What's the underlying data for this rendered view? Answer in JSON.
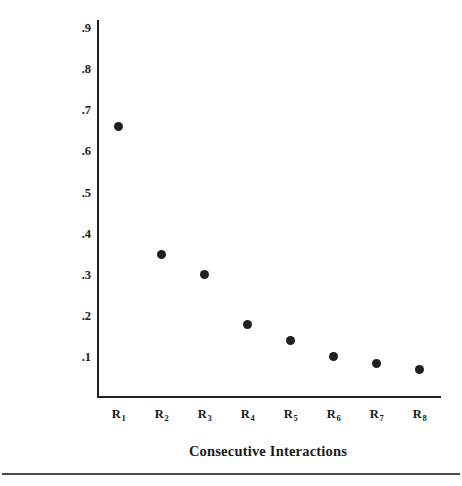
{
  "chart_data": {
    "type": "scatter",
    "title": "",
    "xlabel": "Consecutive Interactions",
    "ylabel": "Likelihood Mother Will Continue",
    "categories": [
      "R1",
      "R2",
      "R3",
      "R4",
      "R5",
      "R6",
      "R7",
      "R8"
    ],
    "category_labels": [
      {
        "base": "R",
        "sub": "1"
      },
      {
        "base": "R",
        "sub": "2"
      },
      {
        "base": "R",
        "sub": "3"
      },
      {
        "base": "R",
        "sub": "4"
      },
      {
        "base": "R",
        "sub": "5"
      },
      {
        "base": "R",
        "sub": "6"
      },
      {
        "base": "R",
        "sub": "7"
      },
      {
        "base": "R",
        "sub": "8"
      }
    ],
    "values": [
      0.66,
      0.35,
      0.3,
      0.18,
      0.14,
      0.1,
      0.085,
      0.07
    ],
    "ylim": [
      0,
      0.92
    ],
    "yticks": [
      0.9,
      0.8,
      0.7,
      0.6,
      0.5,
      0.4,
      0.3,
      0.2,
      0.1
    ],
    "ytick_labels": [
      ".9",
      ".8",
      ".7",
      ".6",
      ".5",
      ".4",
      ".3",
      ".2",
      ".1"
    ],
    "xlim": [
      0.5,
      8.5
    ],
    "grid": false,
    "legend": false,
    "marker_color": "#231f20",
    "axis_color": "#231f20"
  },
  "figure": {
    "xaxis_title": "Consecutive Interactions",
    "yaxis_title": "Likelihood Mother Will Continue"
  }
}
